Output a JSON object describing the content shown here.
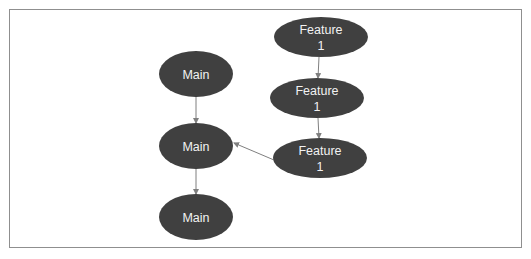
{
  "diagram": {
    "colors": {
      "node_fill": "#404040",
      "node_text": "#f2f2f2",
      "edge": "#7f7f7f",
      "frame": "#8f8f8f"
    },
    "nodes": [
      {
        "id": "main1",
        "lines": [
          "Main"
        ],
        "cx": 196,
        "cy": 74,
        "rx": 37,
        "ry": 23
      },
      {
        "id": "main2",
        "lines": [
          "Main"
        ],
        "cx": 196,
        "cy": 146,
        "rx": 37,
        "ry": 23
      },
      {
        "id": "main3",
        "lines": [
          "Main"
        ],
        "cx": 196,
        "cy": 217,
        "rx": 37,
        "ry": 23
      },
      {
        "id": "feat1a",
        "lines": [
          "Feature",
          "1"
        ],
        "cx": 321,
        "cy": 37,
        "rx": 47,
        "ry": 20
      },
      {
        "id": "feat1b",
        "lines": [
          "Feature",
          "1"
        ],
        "cx": 317,
        "cy": 98,
        "rx": 47,
        "ry": 20
      },
      {
        "id": "feat1c",
        "lines": [
          "Feature",
          "1"
        ],
        "cx": 320,
        "cy": 158,
        "rx": 47,
        "ry": 20
      }
    ],
    "edges": [
      {
        "from": "main1",
        "to": "main2",
        "x1": 196,
        "y1": 97,
        "x2": 196,
        "y2": 123
      },
      {
        "from": "main2",
        "to": "main3",
        "x1": 196,
        "y1": 169,
        "x2": 196,
        "y2": 194
      },
      {
        "from": "feat1a",
        "to": "feat1b",
        "x1": 319,
        "y1": 57,
        "x2": 318,
        "y2": 78
      },
      {
        "from": "feat1b",
        "to": "feat1c",
        "x1": 318,
        "y1": 118,
        "x2": 319,
        "y2": 138
      },
      {
        "from": "feat1c",
        "to": "main2",
        "x1": 274,
        "y1": 160,
        "x2": 234,
        "y2": 143
      }
    ]
  }
}
